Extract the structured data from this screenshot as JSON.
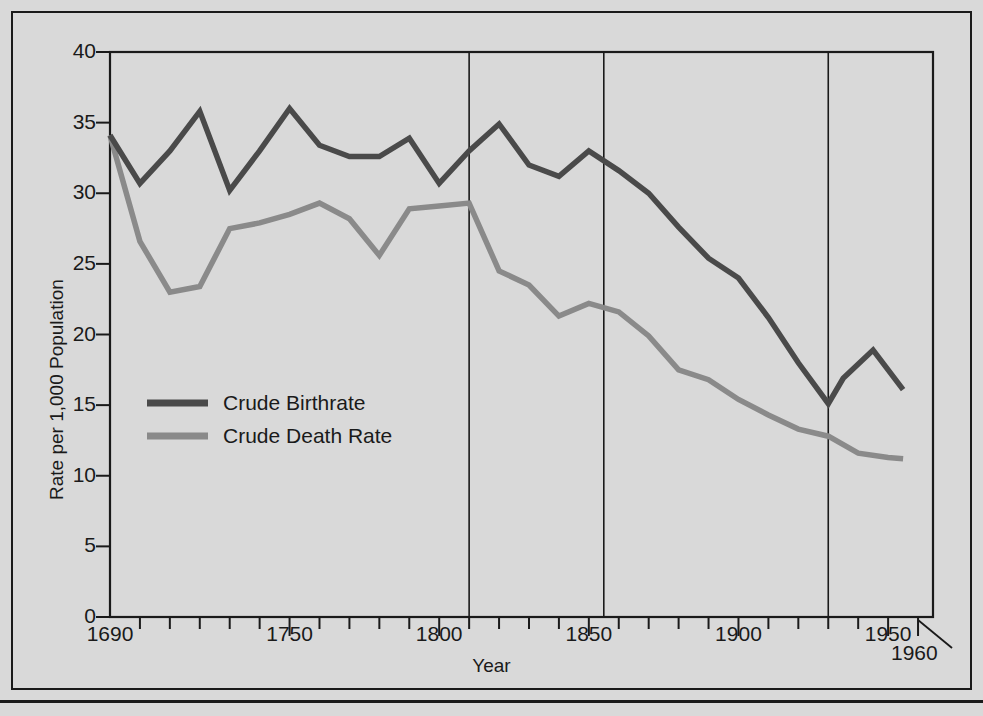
{
  "chart_data": {
    "type": "line",
    "title": "",
    "xlabel": "Year",
    "ylabel": "Rate per 1,000 Population",
    "xlim": [
      1690,
      1965
    ],
    "ylim": [
      0,
      40
    ],
    "grid": "vertical gridlines at 1810, 1855, 1930",
    "legend_position": "inside-left-middle",
    "y_ticks": [
      0,
      5,
      10,
      15,
      20,
      25,
      30,
      35,
      40
    ],
    "y_tick_labels": [
      "0",
      "5",
      "10",
      "15",
      "20",
      "25",
      "30",
      "35",
      "40"
    ],
    "x_ticks_minor_step": 10,
    "x_tick_labels": [
      "1690",
      "1750",
      "1800",
      "1850",
      "1900",
      "1950",
      "1960"
    ],
    "x_tick_label_values": [
      1690,
      1750,
      1800,
      1850,
      1900,
      1950,
      1960
    ],
    "vertical_gridlines": [
      1810,
      1855,
      1930
    ],
    "annotations": [
      {
        "text": "1960",
        "points_to_year": 1960,
        "leader_line": true
      }
    ],
    "series": [
      {
        "name": "Crude Birthrate",
        "color": "#4a4a4a",
        "x": [
          1690,
          1700,
          1710,
          1720,
          1730,
          1740,
          1750,
          1760,
          1770,
          1780,
          1790,
          1800,
          1810,
          1820,
          1830,
          1840,
          1850,
          1860,
          1870,
          1880,
          1890,
          1900,
          1910,
          1920,
          1930,
          1935,
          1945,
          1955
        ],
        "y": [
          34.1,
          30.7,
          33.0,
          35.8,
          30.2,
          33.0,
          36.0,
          33.4,
          32.6,
          32.6,
          33.9,
          30.7,
          33.0,
          34.9,
          32.0,
          31.2,
          33.0,
          31.6,
          30.0,
          27.6,
          25.4,
          24.0,
          21.2,
          18.0,
          15.1,
          16.9,
          18.9,
          16.1
        ]
      },
      {
        "name": "Crude Death Rate",
        "color": "#8a8a8a",
        "x": [
          1690,
          1700,
          1710,
          1720,
          1730,
          1740,
          1750,
          1760,
          1770,
          1780,
          1790,
          1800,
          1810,
          1820,
          1830,
          1840,
          1850,
          1860,
          1870,
          1880,
          1890,
          1900,
          1910,
          1920,
          1930,
          1940,
          1950,
          1955
        ],
        "y": [
          34.1,
          26.6,
          23.0,
          23.4,
          27.5,
          27.9,
          28.5,
          29.3,
          28.2,
          25.6,
          28.9,
          29.1,
          29.3,
          24.5,
          23.5,
          21.3,
          22.2,
          21.6,
          19.9,
          17.5,
          16.8,
          15.4,
          14.3,
          13.3,
          12.8,
          11.6,
          11.3,
          11.2
        ]
      }
    ]
  },
  "legend": {
    "entries": [
      {
        "label": "Crude Birthrate",
        "color": "#4a4a4a"
      },
      {
        "label": "Crude Death Rate",
        "color": "#8a8a8a"
      }
    ]
  },
  "axes": {
    "y_title": "Rate per 1,000 Population",
    "x_title": "Year",
    "y_labels": [
      "40",
      "35",
      "30",
      "25",
      "20",
      "15",
      "10",
      "5",
      "0"
    ],
    "x_labels": [
      "1690",
      "1750",
      "1800",
      "1850",
      "1900",
      "1950"
    ],
    "callout": "1960"
  }
}
